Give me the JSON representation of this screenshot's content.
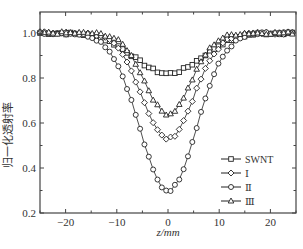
{
  "chart_data": {
    "type": "scatter",
    "title": "",
    "xlabel": "z/mm",
    "ylabel": "归一化透射率",
    "xlim": [
      -25,
      25
    ],
    "ylim": [
      0.2,
      1.08
    ],
    "xticks": [
      -20,
      -10,
      0,
      10,
      20
    ],
    "xtick_labels": [
      "-20",
      "-10",
      "0",
      "10",
      "20"
    ],
    "yticks": [
      0.2,
      0.4,
      0.6,
      0.8,
      1.0
    ],
    "ytick_labels": [
      "0.2",
      "0.4",
      "0.6",
      "0.8",
      "1.0"
    ],
    "grid": false,
    "legend_position": "lower right",
    "series": [
      {
        "name": "SWNT",
        "marker": "square",
        "min_value": 0.82,
        "width_mm": 6.5
      },
      {
        "name": "Ⅰ",
        "marker": "diamond",
        "min_value": 0.53,
        "width_mm": 5.0
      },
      {
        "name": "Ⅱ",
        "marker": "circle",
        "min_value": 0.3,
        "width_mm": 5.5
      },
      {
        "name": "Ⅲ",
        "marker": "triangle",
        "min_value": 0.64,
        "width_mm": 4.5
      }
    ]
  }
}
